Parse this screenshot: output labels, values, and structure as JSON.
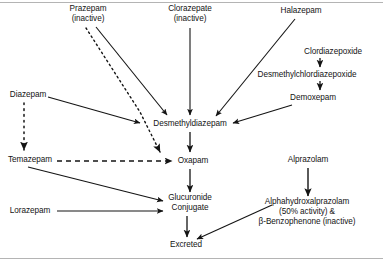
{
  "figure": {
    "type": "metabolic-pathway-diagram",
    "background_color": "#ffffff",
    "line_color": "#141414",
    "rule_color": "#b4b4b4"
  },
  "nodes": [
    {
      "id": "prazepam",
      "line1": "Prazepam",
      "line2": "(inactive)",
      "x": 88,
      "y": 14
    },
    {
      "id": "clorazepate",
      "line1": "Clorazepate",
      "line2": "(inactive)",
      "x": 190,
      "y": 14
    },
    {
      "id": "halazepam",
      "line1": "Halazepam",
      "line2": "",
      "x": 301,
      "y": 11
    },
    {
      "id": "clordiazepoxide",
      "line1": "Clordiazepoxide",
      "line2": "",
      "x": 333,
      "y": 52
    },
    {
      "id": "desmethylchlordiazepoxide",
      "line1": "Desmethylchlordiazepoxide",
      "line2": "",
      "x": 307,
      "y": 75
    },
    {
      "id": "demoxepam",
      "line1": "Demoxepam",
      "line2": "",
      "x": 313,
      "y": 98
    },
    {
      "id": "diazepam",
      "line1": "Diazepam",
      "line2": "",
      "x": 28,
      "y": 95
    },
    {
      "id": "desmethyldiazepam",
      "line1": "Desmethyldiazepam",
      "line2": "",
      "x": 190,
      "y": 124
    },
    {
      "id": "temazepam",
      "line1": "Temazepam",
      "line2": "",
      "x": 30,
      "y": 160
    },
    {
      "id": "oxapam",
      "line1": "Oxapam",
      "line2": "",
      "x": 193,
      "y": 161
    },
    {
      "id": "alprazolam",
      "line1": "Alprazolam",
      "line2": "",
      "x": 308,
      "y": 160
    },
    {
      "id": "glucuronide",
      "line1": "Glucuronide",
      "line2": "Conjugate",
      "x": 190,
      "y": 203
    },
    {
      "id": "lorazepam",
      "line1": "Lorazepam",
      "line2": "",
      "x": 30,
      "y": 211
    },
    {
      "id": "alphahydroxy",
      "line1": "Alphahydroxalprazolam",
      "line2": "(50% activity) &",
      "line3": "β-Benzophenone (inactive)",
      "x": 307,
      "y": 212
    },
    {
      "id": "excreted",
      "line1": "Excreted",
      "line2": "",
      "x": 186,
      "y": 245
    }
  ],
  "edges": [
    {
      "id": "prazepam-to-desmethyldiazepam",
      "from": "prazepam",
      "to": "desmethyldiazepam",
      "style": "solid"
    },
    {
      "id": "prazepam-to-oxapam",
      "from": "prazepam",
      "to": "oxapam",
      "style": "dotted"
    },
    {
      "id": "clorazepate-to-desmethyldiazepam",
      "from": "clorazepate",
      "to": "desmethyldiazepam",
      "style": "solid"
    },
    {
      "id": "halazepam-to-desmethyldiazepam",
      "from": "halazepam",
      "to": "desmethyldiazepam",
      "style": "solid"
    },
    {
      "id": "clordiazepoxide-to-desmethylchlordiazepoxide",
      "from": "clordiazepoxide",
      "to": "desmethylchlordiazepoxide",
      "style": "solid"
    },
    {
      "id": "desmethylchlordiazepoxide-to-demoxepam",
      "from": "desmethylchlordiazepoxide",
      "to": "demoxepam",
      "style": "solid"
    },
    {
      "id": "demoxepam-to-desmethyldiazepam",
      "from": "demoxepam",
      "to": "desmethyldiazepam",
      "style": "solid"
    },
    {
      "id": "diazepam-to-desmethyldiazepam",
      "from": "diazepam",
      "to": "desmethyldiazepam",
      "style": "solid"
    },
    {
      "id": "diazepam-to-temazepam",
      "from": "diazepam",
      "to": "temazepam",
      "style": "dotted"
    },
    {
      "id": "desmethyldiazepam-to-oxapam",
      "from": "desmethyldiazepam",
      "to": "oxapam",
      "style": "solid"
    },
    {
      "id": "temazepam-to-oxapam",
      "from": "temazepam",
      "to": "oxapam",
      "style": "dashed"
    },
    {
      "id": "temazepam-to-glucuronide",
      "from": "temazepam",
      "to": "glucuronide",
      "style": "solid"
    },
    {
      "id": "lorazepam-to-glucuronide",
      "from": "lorazepam",
      "to": "glucuronide",
      "style": "solid"
    },
    {
      "id": "oxapam-to-glucuronide",
      "from": "oxapam",
      "to": "glucuronide",
      "style": "solid"
    },
    {
      "id": "glucuronide-to-excreted",
      "from": "glucuronide",
      "to": "excreted",
      "style": "solid"
    },
    {
      "id": "alprazolam-to-alphahydroxy",
      "from": "alprazolam",
      "to": "alphahydroxy",
      "style": "solid"
    },
    {
      "id": "alphahydroxy-to-excreted",
      "from": "alphahydroxy",
      "to": "excreted",
      "style": "solid"
    }
  ]
}
